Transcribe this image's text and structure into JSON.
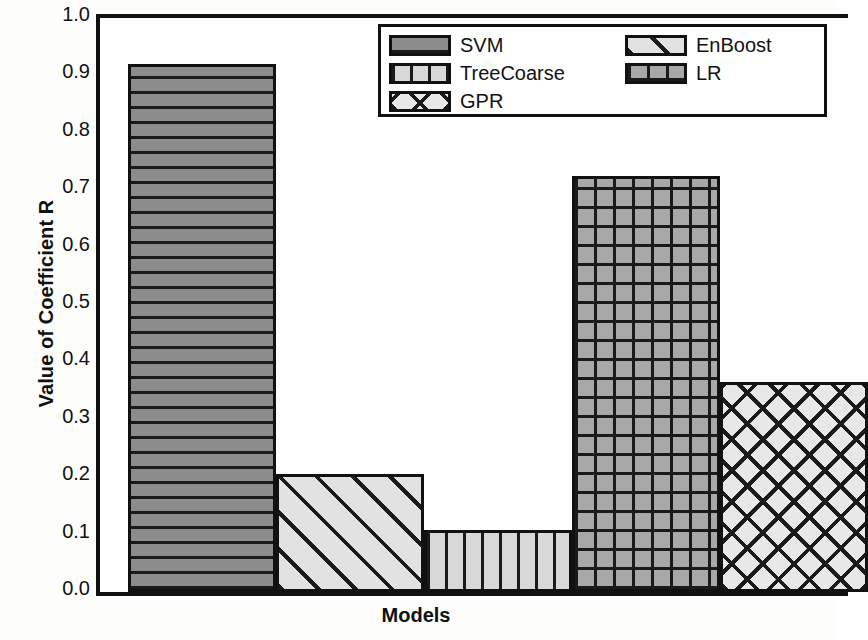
{
  "chart_data": {
    "type": "bar",
    "title": "",
    "xlabel": "Models",
    "ylabel": "Value of Coefficient R",
    "categories": [
      "SVM",
      "EnBoost",
      "TreeCoarse",
      "LR",
      "GPR"
    ],
    "values": [
      0.92,
      0.205,
      0.108,
      0.725,
      0.366
    ],
    "ylim": [
      0.0,
      1.0
    ],
    "ytick_labels": [
      "1.0",
      "0.9",
      "0.8",
      "0.7",
      "0.6",
      "0.5",
      "0.4",
      "0.3",
      "0.2",
      "0.1",
      "0.0"
    ],
    "ytick_values": [
      1.0,
      0.9,
      0.8,
      0.7,
      0.6,
      0.5,
      0.4,
      0.3,
      0.2,
      0.1,
      0.0
    ],
    "xtick_labels": [],
    "grid": false,
    "legend_position": "upper right",
    "series": [
      {
        "name": "SVM",
        "value": 0.92,
        "pattern": "horizontal-lines",
        "fill": "#8c8c8c",
        "line": "#1a1a1a"
      },
      {
        "name": "EnBoost",
        "value": 0.205,
        "pattern": "diagonal-stripes",
        "fill": "#e2e2e2",
        "line": "#1a1a1a"
      },
      {
        "name": "TreeCoarse",
        "value": 0.108,
        "pattern": "vertical-lines",
        "fill": "#d8d8d8",
        "line": "#1a1a1a"
      },
      {
        "name": "LR",
        "value": 0.725,
        "pattern": "grid",
        "fill": "#a8a8a8",
        "line": "#1a1a1a"
      },
      {
        "name": "GPR",
        "value": 0.366,
        "pattern": "diagonal-crosshatch",
        "fill": "#e8e8e8",
        "line": "#1a1a1a"
      }
    ]
  },
  "legend": {
    "rows": [
      [
        {
          "label": "SVM",
          "index": 0
        },
        {
          "label": "EnBoost",
          "index": 1
        }
      ],
      [
        {
          "label": "TreeCoarse",
          "index": 2
        },
        {
          "label": "LR",
          "index": 3
        }
      ],
      [
        {
          "label": "GPR",
          "index": 4
        }
      ]
    ]
  },
  "colors": {
    "axis": "#111111",
    "background": "#ffffff"
  }
}
